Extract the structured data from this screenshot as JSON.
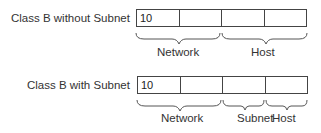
{
  "rows": [
    {
      "label": "Class B without Subnet",
      "cells": [
        "10",
        "",
        "",
        ""
      ],
      "fields": [
        {
          "label": "Network",
          "span": "octets 1-2"
        },
        {
          "label": "Host",
          "span": "octets 3-4"
        }
      ]
    },
    {
      "label": "Class B with Subnet",
      "cells": [
        "10",
        "",
        "",
        ""
      ],
      "fields": [
        {
          "label": "Network",
          "span": "octets 1-2"
        },
        {
          "label": "Subnet",
          "span": "octet 3"
        },
        {
          "label": "Host",
          "span": "octet 4"
        }
      ]
    }
  ]
}
